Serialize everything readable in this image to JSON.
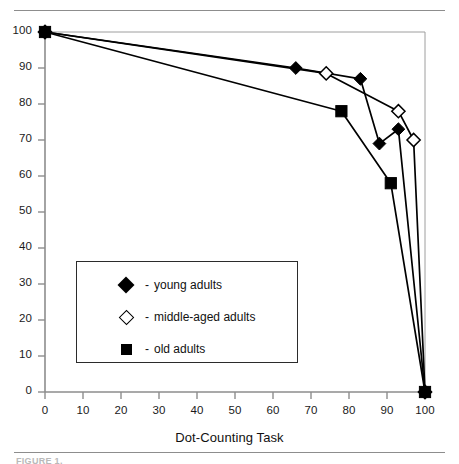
{
  "figure": {
    "caption_stub": "FIGURE 1."
  },
  "chart_data": {
    "type": "line",
    "title": "",
    "xlabel": "Dot-Counting Task",
    "ylabel": "",
    "xlim": [
      0,
      100
    ],
    "ylim": [
      0,
      100
    ],
    "xticks": [
      0,
      10,
      20,
      30,
      40,
      50,
      60,
      70,
      80,
      90,
      100
    ],
    "yticks": [
      0,
      10,
      20,
      30,
      40,
      50,
      60,
      70,
      80,
      90,
      100
    ],
    "xtick_labels": [
      "0",
      "10",
      "20",
      "30",
      "40",
      "50",
      "60",
      "70",
      "80",
      "90",
      "100"
    ],
    "ytick_labels": [
      "0",
      "10",
      "20",
      "30",
      "40",
      "50",
      "60",
      "70",
      "80",
      "90",
      "100"
    ],
    "grid": false,
    "legend_position": "lower-left-inside",
    "series": [
      {
        "name": "young adults",
        "marker": "filled-diamond",
        "color": "#000000",
        "points": [
          {
            "x": 0,
            "y": 100
          },
          {
            "x": 66,
            "y": 90
          },
          {
            "x": 83,
            "y": 87
          },
          {
            "x": 88,
            "y": 69
          },
          {
            "x": 93,
            "y": 73
          },
          {
            "x": 100,
            "y": 0
          }
        ]
      },
      {
        "name": "middle-aged adults",
        "marker": "open-diamond",
        "color": "#000000",
        "points": [
          {
            "x": 0,
            "y": 100
          },
          {
            "x": 74,
            "y": 88.5
          },
          {
            "x": 93,
            "y": 78
          },
          {
            "x": 97,
            "y": 70
          },
          {
            "x": 100,
            "y": 0
          }
        ]
      },
      {
        "name": "old adults",
        "marker": "filled-square",
        "color": "#000000",
        "points": [
          {
            "x": 0,
            "y": 100
          },
          {
            "x": 78,
            "y": 78
          },
          {
            "x": 91,
            "y": 58
          },
          {
            "x": 100,
            "y": 0
          }
        ]
      }
    ]
  },
  "legend": {
    "entries": [
      {
        "dash": "-",
        "label": "young adults",
        "marker": "filled-diamond"
      },
      {
        "dash": "-",
        "label": "middle-aged adults",
        "marker": "open-diamond"
      },
      {
        "dash": "-",
        "label": "old adults",
        "marker": "filled-square"
      }
    ]
  }
}
